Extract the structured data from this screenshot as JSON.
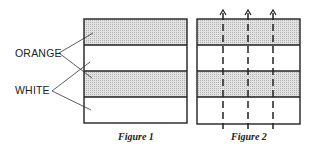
{
  "labels": {
    "orange": "ORANGE",
    "white": "WHITE"
  },
  "figures": [
    {
      "caption": "Figure 1",
      "stripes": [
        "orange",
        "white",
        "orange",
        "white"
      ]
    },
    {
      "caption": "Figure 2",
      "stripes": [
        "orange",
        "white",
        "orange",
        "white"
      ],
      "cut_lines": 3,
      "cut_line_style": "dashed-with-arrow-up"
    }
  ],
  "colors": {
    "orange_fill": "#cfcfcf",
    "white_fill": "#ffffff",
    "stroke": "#222222"
  }
}
